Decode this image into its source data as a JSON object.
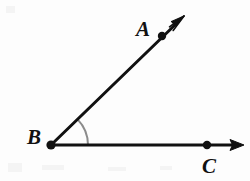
{
  "figure": {
    "type": "geometry-angle-diagram",
    "width": 250,
    "height": 181,
    "background_color": "#fdfdfd",
    "stroke_color": "#111111",
    "arc_color": "#8c8c8c",
    "stroke_width": 3,
    "arc_stroke_width": 2
  },
  "points": [
    {
      "id": "A",
      "label": "A",
      "dot_x": 162,
      "dot_y": 36,
      "label_x": 143,
      "label_y": 29
    },
    {
      "id": "B",
      "label": "B",
      "dot_x": 51,
      "dot_y": 145,
      "label_x": 34,
      "label_y": 137
    },
    {
      "id": "C",
      "label": "C",
      "dot_x": 207,
      "dot_y": 145,
      "label_x": 209,
      "label_y": 166
    }
  ],
  "rays": [
    {
      "id": "ray-BA",
      "name": "ray-ba",
      "from": "B",
      "through": "A",
      "start_x": 51,
      "start_y": 145,
      "end_x": 183,
      "end_y": 17,
      "arrow": "end"
    },
    {
      "id": "ray-BC",
      "name": "ray-bc",
      "from": "B",
      "through": "C",
      "start_x": 51,
      "start_y": 145,
      "end_x": 243,
      "end_y": 145,
      "arrow": "end"
    }
  ],
  "angle_arc": {
    "vertex": "B",
    "vertex_x": 51,
    "vertex_y": 145,
    "radius": 37,
    "start_x": 88,
    "start_y": 145,
    "end_x": 77,
    "end_y": 119,
    "sweep_degrees": 44,
    "color": "#8c8c8c"
  },
  "dots": {
    "radius": 4,
    "color": "#111111"
  }
}
